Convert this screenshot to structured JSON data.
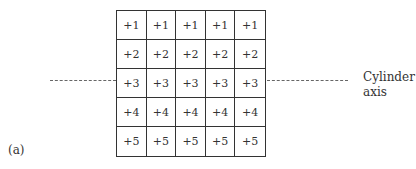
{
  "figure": {
    "panel_label": "(a)",
    "axis_label_line1": "Cylinder",
    "axis_label_line2": "axis",
    "grid": {
      "rows": [
        [
          "+1",
          "+1",
          "+1",
          "+1",
          "+1"
        ],
        [
          "+2",
          "+2",
          "+2",
          "+2",
          "+2"
        ],
        [
          "+3",
          "+3",
          "+3",
          "+3",
          "+3"
        ],
        [
          "+4",
          "+4",
          "+4",
          "+4",
          "+4"
        ],
        [
          "+5",
          "+5",
          "+5",
          "+5",
          "+5"
        ]
      ]
    }
  }
}
